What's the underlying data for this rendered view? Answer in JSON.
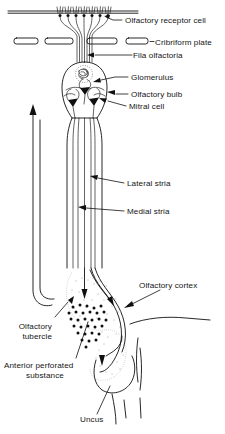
{
  "figure": {
    "background_color": "#ffffff",
    "ink_color": "#101010"
  },
  "labels": {
    "olfactory_receptor_cell": "Olfactory receptor cell",
    "cribriform_plate": "Cribriform plate",
    "fila_olfactoria": "Fila olfactoria",
    "glomerulus": "Glomerulus",
    "olfactory_bulb": "Olfactory bulb",
    "mitral_cell": "Mitral  cell",
    "lateral_stria": "Lateral stria",
    "medial_stria": "Medial stria",
    "olfactory_cortex": "Olfactory cortex",
    "olfactory_tubercle_line1": "Olfactory",
    "olfactory_tubercle_line2": "tubercle",
    "anterior_perforated_line1": "Anterior perforated",
    "anterior_perforated_line2": "substance",
    "uncus": "Uncus"
  },
  "structures": {
    "cribriform_plate_segments": 4,
    "receptor_cell_count": 7,
    "tract_fiber_count": 5,
    "perforation_dot_count": 30
  }
}
